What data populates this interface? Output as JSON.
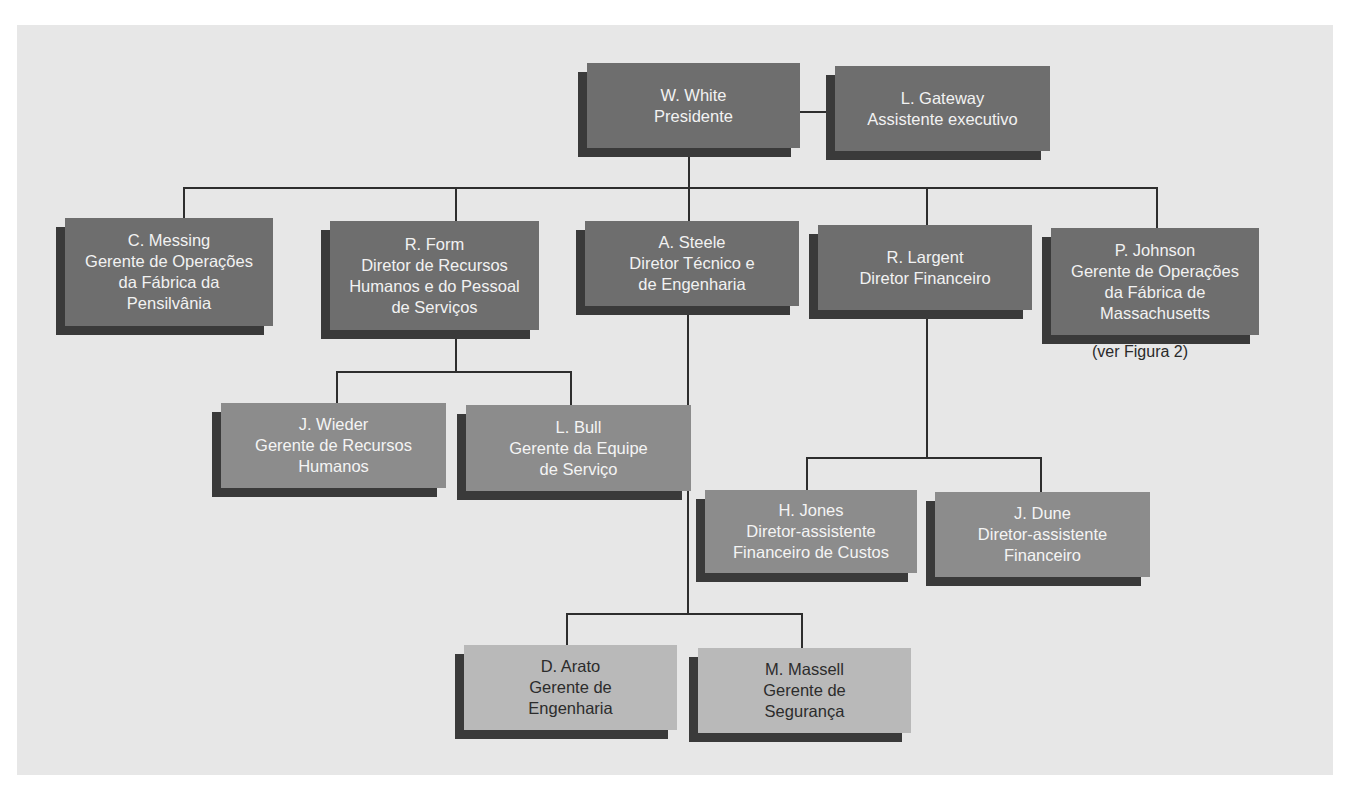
{
  "chart": {
    "type": "org-chart",
    "president": {
      "name": "W. White",
      "lines": [
        "W. White",
        "Presidente"
      ]
    },
    "assistant": {
      "name": "L. Gateway",
      "lines": [
        "L. Gateway",
        "Assistente executivo"
      ]
    },
    "level2": [
      {
        "name": "C. Messing",
        "lines": [
          "C. Messing",
          "Gerente de Operações",
          "da Fábrica da",
          "Pensilvânia"
        ]
      },
      {
        "name": "R. Form",
        "lines": [
          "R. Form",
          "Diretor de Recursos",
          "Humanos e do Pessoal",
          "de Serviços"
        ]
      },
      {
        "name": "A. Steele",
        "lines": [
          "A. Steele",
          "Diretor Técnico e",
          "de Engenharia"
        ]
      },
      {
        "name": "R. Largent",
        "lines": [
          "R. Largent",
          "Diretor Financeiro"
        ]
      },
      {
        "name": "P. Johnson",
        "lines": [
          "P. Johnson",
          "Gerente de Operações",
          "da Fábrica de",
          "Massachusetts"
        ]
      }
    ],
    "johnson_note": "(ver Figura 2)",
    "form_reports": [
      {
        "name": "J. Wieder",
        "lines": [
          "J. Wieder",
          "Gerente de Recursos",
          "Humanos"
        ]
      },
      {
        "name": "L. Bull",
        "lines": [
          "L. Bull",
          "Gerente da Equipe",
          "de Serviço"
        ]
      }
    ],
    "largent_reports": [
      {
        "name": "H. Jones",
        "lines": [
          "H. Jones",
          "Diretor-assistente",
          "Financeiro de Custos"
        ]
      },
      {
        "name": "J. Dune",
        "lines": [
          "J. Dune",
          "Diretor-assistente",
          "Financeiro"
        ]
      }
    ],
    "steele_reports": [
      {
        "name": "D. Arato",
        "lines": [
          "D. Arato",
          "Gerente de",
          "Engenharia"
        ]
      },
      {
        "name": "M. Massell",
        "lines": [
          "M. Massell",
          "Gerente de",
          "Segurança"
        ]
      }
    ]
  },
  "colors": {
    "background": "#e7e7e7",
    "dark_box": "#6e6e6e",
    "mid_box": "#8c8c8c",
    "light_box": "#b9b9b9",
    "shadow": "#3a3a3a",
    "connector": "#2e2e2e"
  }
}
